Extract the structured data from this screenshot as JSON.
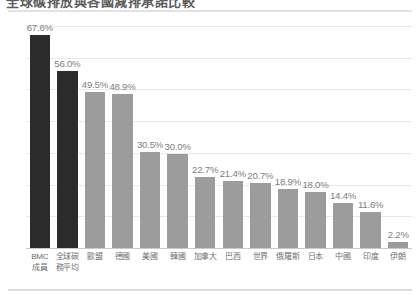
{
  "header": {
    "title_clipped": "全球碳排放與各國減排承諾比較",
    "rule_top_name": "top-divider",
    "rule_bottom_name": "bottom-divider"
  },
  "chart_data": {
    "type": "bar",
    "title": "全球碳排放與各國減排承諾比較",
    "xlabel": "",
    "ylabel": "",
    "ylim": [
      0,
      70
    ],
    "grid": true,
    "gridline_values": [
      0,
      10,
      20,
      30,
      40,
      50,
      60,
      70
    ],
    "legend": "none",
    "categories": [
      "BMC\n成員",
      "全球碳\n務平均",
      "歐盟",
      "德國",
      "美國",
      "韓國",
      "加拿大",
      "巴西",
      "世界",
      "俄羅斯",
      "日本",
      "中國",
      "印度",
      "伊朗"
    ],
    "category_lines": [
      [
        "BMC",
        "成員"
      ],
      [
        "全球碳",
        "務平均"
      ],
      [
        "歐盟",
        ""
      ],
      [
        "德國",
        ""
      ],
      [
        "美國",
        ""
      ],
      [
        "韓國",
        ""
      ],
      [
        "加拿大",
        ""
      ],
      [
        "巴西",
        ""
      ],
      [
        "世界",
        ""
      ],
      [
        "俄羅斯",
        ""
      ],
      [
        "日本",
        ""
      ],
      [
        "中國",
        ""
      ],
      [
        "印度",
        ""
      ],
      [
        "伊朗",
        ""
      ]
    ],
    "values": [
      67.6,
      56.0,
      49.5,
      48.9,
      30.5,
      30.0,
      22.7,
      21.4,
      20.7,
      18.9,
      18.0,
      14.4,
      11.6,
      2.2
    ],
    "labels": [
      "67.6%",
      "56.0%",
      "49.5%",
      "48.9%",
      "30.5%",
      "30.0%",
      "22.7%",
      "21.4%",
      "20.7%",
      "18.9%",
      "18.0%",
      "14.4%",
      "11.6%",
      "2.2%"
    ],
    "bar_colors": [
      "#2b2b2b",
      "#2b2b2b",
      "#9c9c9c",
      "#9c9c9c",
      "#9c9c9c",
      "#9c9c9c",
      "#9c9c9c",
      "#9c9c9c",
      "#9c9c9c",
      "#9c9c9c",
      "#9c9c9c",
      "#9c9c9c",
      "#9c9c9c",
      "#9c9c9c"
    ],
    "highlight_color": "#2b2b2b",
    "base_color": "#9c9c9c",
    "gridline_color": "#e9e9ea",
    "label_color": "#7e7e7e"
  }
}
